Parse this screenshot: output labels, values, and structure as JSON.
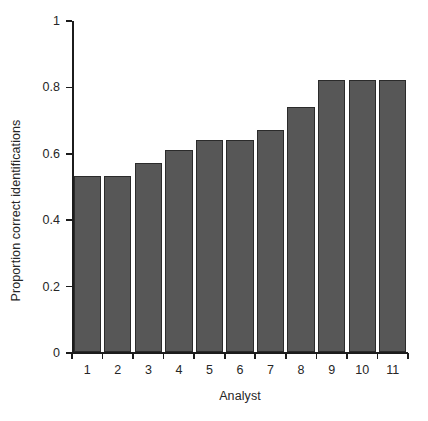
{
  "chart_data": {
    "type": "bar",
    "title": "",
    "xlabel": "Analyst",
    "ylabel": "Proportion correct identifications",
    "categories": [
      "1",
      "2",
      "3",
      "4",
      "5",
      "6",
      "7",
      "8",
      "9",
      "10",
      "11"
    ],
    "values": [
      0.53,
      0.53,
      0.57,
      0.61,
      0.64,
      0.64,
      0.67,
      0.74,
      0.82,
      0.82,
      0.82
    ],
    "ylim": [
      0,
      1
    ],
    "yticks": [
      0,
      0.2,
      0.4,
      0.6,
      0.8,
      1
    ],
    "ytick_labels": [
      "0",
      "0.2",
      "0.4",
      "0.6",
      "0.8",
      "1"
    ],
    "grid": false,
    "legend": null,
    "bar_color": "#575757",
    "bar_edge_color": "#2b2b2b",
    "axis_color": "#1c1c1c",
    "background_color": "#ffffff"
  }
}
